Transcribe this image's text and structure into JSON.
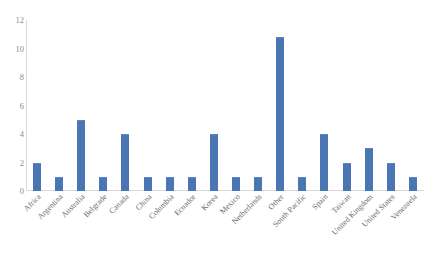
{
  "chart_data": {
    "type": "bar",
    "title": "",
    "xlabel": "",
    "ylabel": "",
    "ylim": [
      0,
      12
    ],
    "yticks": [
      0,
      2,
      4,
      6,
      8,
      10,
      12
    ],
    "grid": false,
    "legend": "none",
    "bar_color": "#4a76b4",
    "axis_color": "#d9d9d9",
    "tick_label_color": "#8c8c8c",
    "categories": [
      "Africa",
      "Argentina",
      "Australia",
      "Belgrade",
      "Canada",
      "China",
      "Columbia",
      "Ecuador",
      "Korea",
      "Mexico",
      "Netherlands",
      "Other",
      "South Pacific",
      "Spain",
      "Taiwan",
      "United Kingdom",
      "United States",
      "Venezuela"
    ],
    "values": [
      2,
      1,
      5,
      1,
      4,
      1,
      1,
      1,
      4,
      1,
      1,
      10.8,
      1,
      4,
      2,
      3,
      2,
      1
    ]
  }
}
